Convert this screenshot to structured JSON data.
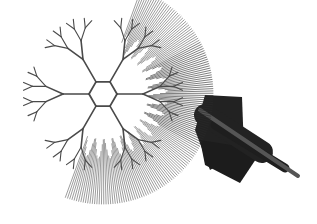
{
  "figure": {
    "background": "#ffffff",
    "stroke_color": "#4a4a4a",
    "dark_color": "#1a1a1a",
    "center": [
      103,
      94
    ],
    "hex_radius": 14,
    "sparse_depth": 4,
    "dense_start_angle_deg": -70,
    "dense_end_angle_deg": 110,
    "fan_origin": [
      103,
      94
    ],
    "fan_radius": 110,
    "spikes": [
      {
        "x1": 200,
        "y1": 110,
        "x2": 298,
        "y2": 176,
        "width": 4,
        "color": "#555555"
      },
      {
        "x1": 215,
        "y1": 125,
        "x2": 285,
        "y2": 168,
        "width": 9,
        "color": "#1e1e1e"
      },
      {
        "x1": 205,
        "y1": 115,
        "x2": 262,
        "y2": 152,
        "width": 22,
        "color": "#222222"
      }
    ],
    "dark_blocks": [
      {
        "points": "205,95 242,97 244,150 210,170 195,130",
        "color": "#222222"
      },
      {
        "points": "200,140 262,150 240,183 205,165",
        "color": "#1c1c1c"
      }
    ]
  }
}
